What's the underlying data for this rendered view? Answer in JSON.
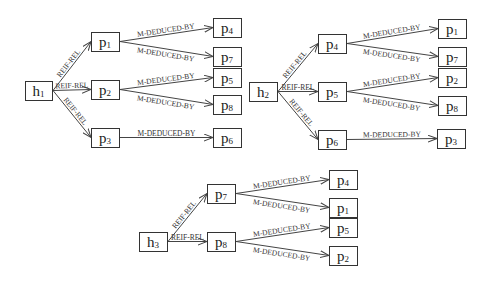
{
  "diagram": {
    "edge_labels": {
      "reif": "REIF-REL",
      "deduced": "M-DEDUCED-BY"
    },
    "groups": [
      {
        "root": {
          "base": "h",
          "sub": "1",
          "x": 25,
          "y": 81,
          "w": 27,
          "h": 19
        },
        "mid": [
          {
            "base": "p",
            "sub": "1",
            "x": 91,
            "y": 32,
            "w": 28,
            "h": 19,
            "children": [
              {
                "base": "p",
                "sub": "4",
                "x": 213,
                "y": 18,
                "w": 28,
                "h": 19
              },
              {
                "base": "p",
                "sub": "7",
                "x": 213,
                "y": 47,
                "w": 28,
                "h": 19
              }
            ]
          },
          {
            "base": "p",
            "sub": "2",
            "x": 91,
            "y": 80,
            "w": 28,
            "h": 19,
            "children": [
              {
                "base": "p",
                "sub": "5",
                "x": 213,
                "y": 68,
                "w": 28,
                "h": 19
              },
              {
                "base": "p",
                "sub": "8",
                "x": 213,
                "y": 95,
                "w": 28,
                "h": 19
              }
            ]
          },
          {
            "base": "p",
            "sub": "3",
            "x": 91,
            "y": 128,
            "w": 28,
            "h": 19,
            "children": [
              {
                "base": "p",
                "sub": "6",
                "x": 213,
                "y": 128,
                "w": 28,
                "h": 19
              }
            ]
          }
        ]
      },
      {
        "root": {
          "base": "h",
          "sub": "2",
          "x": 249,
          "y": 82,
          "w": 28,
          "h": 19
        },
        "mid": [
          {
            "base": "p",
            "sub": "4",
            "x": 318,
            "y": 34,
            "w": 28,
            "h": 19,
            "children": [
              {
                "base": "p",
                "sub": "1",
                "x": 438,
                "y": 19,
                "w": 28,
                "h": 19
              },
              {
                "base": "p",
                "sub": "7",
                "x": 438,
                "y": 47,
                "w": 28,
                "h": 19
              }
            ]
          },
          {
            "base": "p",
            "sub": "5",
            "x": 318,
            "y": 82,
            "w": 28,
            "h": 19,
            "children": [
              {
                "base": "p",
                "sub": "2",
                "x": 438,
                "y": 68,
                "w": 28,
                "h": 19
              },
              {
                "base": "p",
                "sub": "8",
                "x": 438,
                "y": 96,
                "w": 28,
                "h": 19
              }
            ]
          },
          {
            "base": "p",
            "sub": "6",
            "x": 318,
            "y": 130,
            "w": 28,
            "h": 19,
            "children": [
              {
                "base": "p",
                "sub": "3",
                "x": 437,
                "y": 129,
                "w": 28,
                "h": 19
              }
            ]
          }
        ]
      },
      {
        "root": {
          "base": "h",
          "sub": "3",
          "x": 139,
          "y": 232,
          "w": 28,
          "h": 19
        },
        "mid": [
          {
            "base": "p",
            "sub": "7",
            "x": 207,
            "y": 184,
            "w": 28,
            "h": 19,
            "children": [
              {
                "base": "p",
                "sub": "4",
                "x": 329,
                "y": 170,
                "w": 28,
                "h": 19
              },
              {
                "base": "p",
                "sub": "1",
                "x": 329,
                "y": 198,
                "w": 28,
                "h": 19
              }
            ]
          },
          {
            "base": "p",
            "sub": "8",
            "x": 207,
            "y": 232,
            "w": 28,
            "h": 19,
            "children": [
              {
                "base": "p",
                "sub": "5",
                "x": 329,
                "y": 218,
                "w": 28,
                "h": 19
              },
              {
                "base": "p",
                "sub": "2",
                "x": 329,
                "y": 246,
                "w": 28,
                "h": 19
              }
            ]
          }
        ]
      }
    ]
  }
}
